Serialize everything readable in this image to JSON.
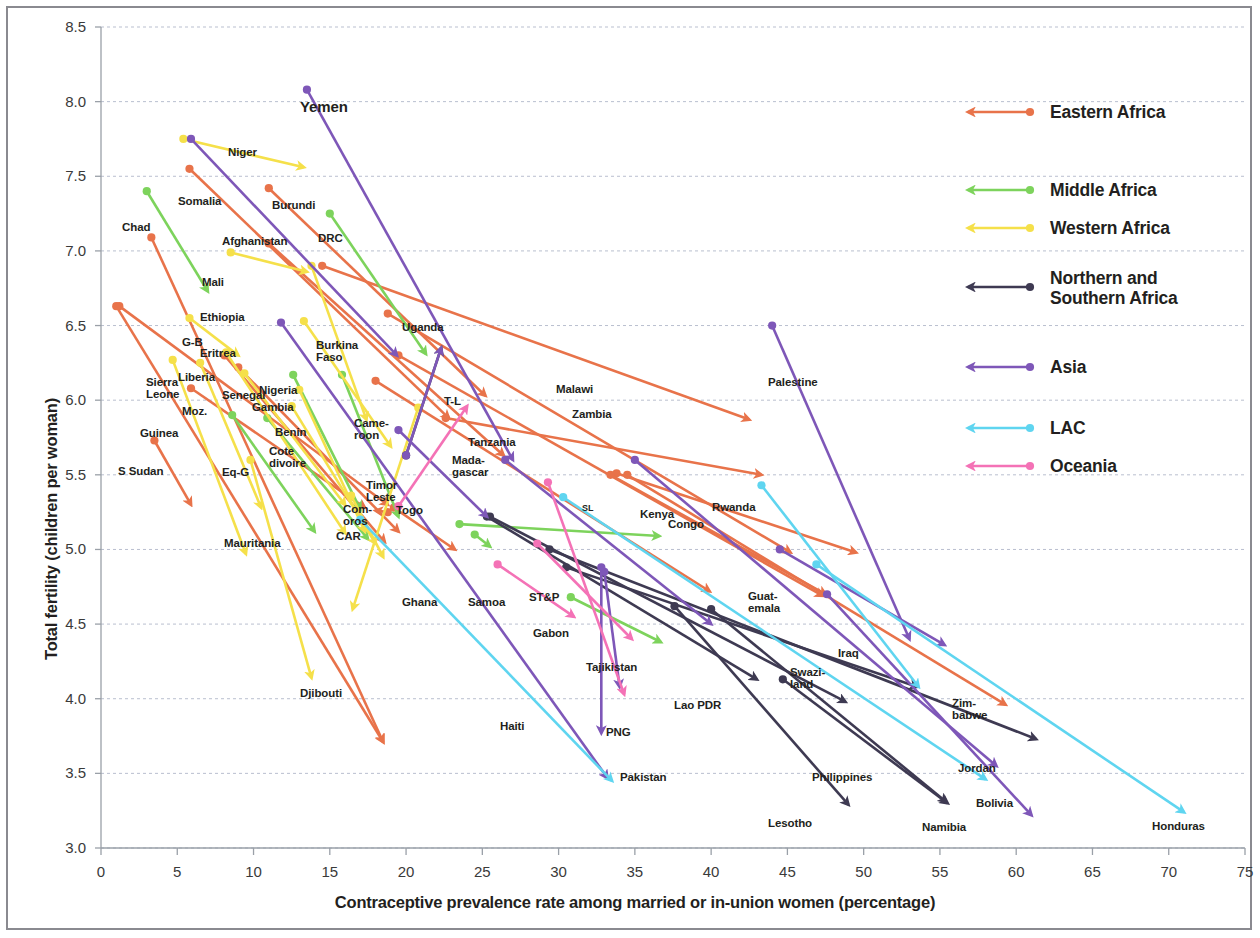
{
  "figure": {
    "xlabel": "Contraceptive prevalence rate among married or in-union women (percentage)",
    "ylabel": "Total fertility (children per woman)"
  },
  "legend": {
    "items": [
      {
        "label": "Eastern Africa",
        "color": "#E8734A",
        "y": 66,
        "lines": 1
      },
      {
        "label": "Middle Africa",
        "color": "#7DD35C",
        "y": 144,
        "lines": 1
      },
      {
        "label": "Western Africa",
        "color": "#F5E04A",
        "y": 182,
        "lines": 1
      },
      {
        "label": "Northern and Southern Africa",
        "color": "#3E3A52",
        "y": 241,
        "lines": 2
      },
      {
        "label": "Asia",
        "color": "#7E57B8",
        "y": 321,
        "lines": 1
      },
      {
        "label": "LAC",
        "color": "#5FD5F0",
        "y": 382,
        "lines": 1
      },
      {
        "label": "Oceania",
        "color": "#F472B6",
        "y": 420,
        "lines": 1
      }
    ]
  },
  "chart_data": {
    "type": "scatter",
    "subtype": "arrow-connected-scatter",
    "title": "",
    "xlabel": "Contraceptive prevalence rate among married or in-union women (percentage)",
    "ylabel": "Total fertility (children per woman)",
    "xlim": [
      0,
      75
    ],
    "ylim": [
      3.0,
      8.5
    ],
    "xticks": [
      0,
      5,
      10,
      15,
      20,
      25,
      30,
      35,
      40,
      45,
      50,
      55,
      60,
      65,
      70,
      75
    ],
    "yticks": [
      3.0,
      3.5,
      4.0,
      4.5,
      5.0,
      5.5,
      6.0,
      6.5,
      7.0,
      7.5,
      8.0,
      8.5
    ],
    "grid": "horizontal-dashed",
    "legend_position": "right",
    "note": "Each segment is an arrow from a start point (dot) to an end point (arrowhead), showing change over time per country.",
    "series": [
      {
        "name": "Eastern Africa",
        "color": "#E8734A",
        "points": [
          {
            "country": "Somalia",
            "x0": 5.8,
            "y0": 7.55,
            "x1": 22.8,
            "y1": 5.88,
            "label": "Somalia",
            "lx": 178,
            "ly": 196
          },
          {
            "country": "Burundi",
            "x0": 11.0,
            "y0": 7.42,
            "x1": 25.2,
            "y1": 6.03,
            "label": "Burundi",
            "lx": 272,
            "ly": 200
          },
          {
            "country": "Chad",
            "x0": 3.3,
            "y0": 7.09,
            "x1": 18.5,
            "y1": 3.71,
            "label": "Chad",
            "lx": 122,
            "ly": 222
          },
          {
            "country": "Afghanistan",
            "x0": 11.0,
            "y0": 7.05,
            "x1": 26.4,
            "y1": 5.63,
            "label": "Afghanistan",
            "lx": 222,
            "ly": 236
          },
          {
            "country": "Ethiopia",
            "x0": 1.2,
            "y0": 6.63,
            "x1": 18.8,
            "y1": 5.3,
            "label": "Ethiopia",
            "lx": 200,
            "ly": 312
          },
          {
            "country": "Uganda",
            "x0": 14.5,
            "y0": 6.9,
            "x1": 42.5,
            "y1": 5.87,
            "label": "Uganda",
            "lx": 402,
            "ly": 322
          },
          {
            "country": "Eritrea",
            "x0": 8.1,
            "y0": 6.3,
            "x1": 18.6,
            "y1": 5.05,
            "label": "Eritrea",
            "lx": 200,
            "ly": 348
          },
          {
            "country": "Malawi",
            "x0": 18.8,
            "y0": 6.58,
            "x1": 45.2,
            "y1": 4.98,
            "label": "Malawi",
            "lx": 556,
            "ly": 384
          },
          {
            "country": "Zambia",
            "x0": 19.5,
            "y0": 6.3,
            "x1": 47.3,
            "y1": 4.69,
            "label": "Zambia",
            "lx": 572,
            "ly": 409
          },
          {
            "country": "Mozambique",
            "x0": 5.9,
            "y0": 6.08,
            "x1": 17.3,
            "y1": 5.28,
            "label": "Moz.",
            "lx": 182,
            "ly": 406
          },
          {
            "country": "Cameroon",
            "x0": 18.0,
            "y0": 6.13,
            "x1": 39.9,
            "y1": 4.72,
            "label": "Came-\nroon",
            "lx": 354,
            "ly": 418
          },
          {
            "country": "Guinea",
            "x0": 3.5,
            "y0": 5.73,
            "x1": 5.9,
            "y1": 5.3,
            "label": "Guinea",
            "lx": 140,
            "ly": 428
          },
          {
            "country": "Tanzania",
            "x0": 22.6,
            "y0": 5.88,
            "x1": 43.3,
            "y1": 5.5,
            "label": "Tanzania",
            "lx": 468,
            "ly": 437
          },
          {
            "country": "S Sudan",
            "x0": 9.0,
            "y0": 6.22,
            "x1": 19.5,
            "y1": 5.12,
            "label": "S Sudan",
            "lx": 118,
            "ly": 466
          },
          {
            "country": "Comoros",
            "x0": 18.8,
            "y0": 5.25,
            "x1": 18.0,
            "y1": 5.26,
            "label": "Com-\noros",
            "lx": 343,
            "ly": 504
          },
          {
            "country": "Togo",
            "x0": 19.2,
            "y0": 5.28,
            "x1": 23.2,
            "y1": 5.0,
            "label": "Togo",
            "lx": 396,
            "ly": 505
          },
          {
            "country": "Rwanda",
            "x0": 33.8,
            "y0": 5.51,
            "x1": 49.5,
            "y1": 4.98,
            "label": "Rwanda",
            "lx": 712,
            "ly": 502
          },
          {
            "country": "Kenya",
            "x0": 33.4,
            "y0": 5.5,
            "x1": 47.5,
            "y1": 4.7,
            "label": "Kenya",
            "lx": 640,
            "ly": 509
          },
          {
            "country": "Zimbabwe",
            "x0": 34.5,
            "y0": 5.5,
            "x1": 59.3,
            "y1": 3.96,
            "label": "Zim-\nbabwe",
            "lx": 952,
            "ly": 698
          },
          {
            "country": "Djibouti",
            "x0": 1.0,
            "y0": 6.63,
            "x1": 18.5,
            "y1": 3.71,
            "label": "Djibouti",
            "lx": 300,
            "ly": 688
          }
        ]
      },
      {
        "name": "Middle Africa",
        "color": "#7DD35C",
        "points": [
          {
            "country": "Chad MA",
            "x0": 3.0,
            "y0": 7.4,
            "x1": 7.0,
            "y1": 6.73,
            "label": "",
            "lx": 0,
            "ly": 0
          },
          {
            "country": "DRC",
            "x0": 15.0,
            "y0": 7.25,
            "x1": 21.3,
            "y1": 6.31,
            "label": "DRC",
            "lx": 318,
            "ly": 233
          },
          {
            "country": "Eq-G",
            "x0": 12.6,
            "y0": 6.17,
            "x1": 17.0,
            "y1": 5.27,
            "label": "Eq-G",
            "lx": 222,
            "ly": 467
          },
          {
            "country": "Gabon",
            "x0": 30.8,
            "y0": 4.68,
            "x1": 36.7,
            "y1": 4.38,
            "label": "Gabon",
            "lx": 533,
            "ly": 628
          },
          {
            "country": "Congo",
            "x0": 23.5,
            "y0": 5.17,
            "x1": 36.6,
            "y1": 5.09,
            "label": "Congo",
            "lx": 668,
            "ly": 519
          },
          {
            "country": "Cameroon MA",
            "x0": 8.6,
            "y0": 5.9,
            "x1": 14.0,
            "y1": 5.12,
            "label": "",
            "lx": 0,
            "ly": 0
          },
          {
            "country": "CAR",
            "x0": 10.9,
            "y0": 5.88,
            "x1": 17.5,
            "y1": 5.07,
            "label": "CAR",
            "lx": 336,
            "ly": 531
          },
          {
            "country": "ST&P",
            "x0": 24.5,
            "y0": 5.1,
            "x1": 25.5,
            "y1": 5.02,
            "label": "ST&P",
            "lx": 529,
            "ly": 592
          },
          {
            "country": "Angola",
            "x0": 15.8,
            "y0": 6.17,
            "x1": 19.5,
            "y1": 5.22,
            "label": "",
            "lx": 0,
            "ly": 0
          }
        ]
      },
      {
        "name": "Western Africa",
        "color": "#F5E04A",
        "points": [
          {
            "country": "Niger",
            "x0": 5.4,
            "y0": 7.75,
            "x1": 13.3,
            "y1": 7.56,
            "label": "Niger",
            "lx": 228,
            "ly": 147
          },
          {
            "country": "Mali",
            "x0": 8.5,
            "y0": 6.99,
            "x1": 13.5,
            "y1": 6.86,
            "label": "Mali",
            "lx": 202,
            "ly": 277
          },
          {
            "country": "Burkina Faso",
            "x0": 13.8,
            "y0": 6.9,
            "x1": 17.4,
            "y1": 5.87,
            "label": "Burkina\nFaso",
            "lx": 316,
            "ly": 340
          },
          {
            "country": "G-B",
            "x0": 5.8,
            "y0": 6.55,
            "x1": 9.0,
            "y1": 6.3,
            "label": "G-B",
            "lx": 182,
            "ly": 337
          },
          {
            "country": "Nigeria",
            "x0": 13.3,
            "y0": 6.53,
            "x1": 19.0,
            "y1": 5.69,
            "label": "Nigeria",
            "lx": 259,
            "ly": 385
          },
          {
            "country": "Senegal",
            "x0": 8.2,
            "y0": 6.32,
            "x1": 16.0,
            "y1": 5.11,
            "label": "Senegal",
            "lx": 222,
            "ly": 390
          },
          {
            "country": "Liberia",
            "x0": 6.5,
            "y0": 6.25,
            "x1": 10.5,
            "y1": 5.28,
            "label": "Liberia",
            "lx": 178,
            "ly": 372
          },
          {
            "country": "Gambia",
            "x0": 9.4,
            "y0": 6.18,
            "x1": 16.0,
            "y1": 5.3,
            "label": "Gambia",
            "lx": 252,
            "ly": 402
          },
          {
            "country": "Sierra Leone",
            "x0": 4.7,
            "y0": 6.27,
            "x1": 9.5,
            "y1": 4.97,
            "label": "Sierra\nLeone",
            "lx": 146,
            "ly": 377
          },
          {
            "country": "Benin",
            "x0": 13.0,
            "y0": 6.07,
            "x1": 17.3,
            "y1": 5.12,
            "label": "Benin",
            "lx": 275,
            "ly": 427
          },
          {
            "country": "Cote divoire",
            "x0": 12.5,
            "y0": 5.96,
            "x1": 18.0,
            "y1": 5.04,
            "label": "Cote\ndivoire",
            "lx": 269,
            "ly": 446
          },
          {
            "country": "Mauritania",
            "x0": 9.8,
            "y0": 5.6,
            "x1": 13.8,
            "y1": 4.14,
            "label": "Mauritania",
            "lx": 224,
            "ly": 538
          },
          {
            "country": "Togo WA",
            "x0": 16.4,
            "y0": 5.36,
            "x1": 18.5,
            "y1": 4.95,
            "label": "",
            "lx": 0,
            "ly": 0
          },
          {
            "country": "Ghana",
            "x0": 20.8,
            "y0": 5.95,
            "x1": 16.5,
            "y1": 4.6,
            "label": "Ghana",
            "lx": 402,
            "ly": 597
          }
        ]
      },
      {
        "name": "Northern and Southern Africa",
        "color": "#3E3A52",
        "points": [
          {
            "country": "Timor Leste",
            "x0": 20.0,
            "y0": 5.63,
            "x1": 22.3,
            "y1": 6.35,
            "label": "Timor\nLeste",
            "lx": 366,
            "ly": 480
          },
          {
            "country": "Madagascar",
            "x0": 25.3,
            "y0": 5.22,
            "x1": 43.0,
            "y1": 4.13,
            "label": "Mada-\ngascar",
            "lx": 452,
            "ly": 455
          },
          {
            "country": "Swaziland",
            "x0": 44.7,
            "y0": 4.13,
            "x1": 55.5,
            "y1": 3.3,
            "label": "Swazi-\nland",
            "lx": 790,
            "ly": 667
          },
          {
            "country": "Lesotho",
            "x0": 37.6,
            "y0": 4.62,
            "x1": 49.0,
            "y1": 3.29,
            "label": "Lesotho",
            "lx": 768,
            "ly": 818
          },
          {
            "country": "Namibia",
            "x0": 40.0,
            "y0": 4.6,
            "x1": 55.4,
            "y1": 3.31,
            "label": "Namibia",
            "lx": 922,
            "ly": 822
          },
          {
            "country": "Lao PDR",
            "x0": 29.4,
            "y0": 5.0,
            "x1": 61.3,
            "y1": 3.73,
            "label": "Lao PDR",
            "lx": 674,
            "ly": 700
          },
          {
            "country": "Jordan NS",
            "x0": 30.5,
            "y0": 4.88,
            "x1": 53.5,
            "y1": 4.08,
            "label": "",
            "lx": 0,
            "ly": 0
          },
          {
            "country": "NS e",
            "x0": 25.5,
            "y0": 5.22,
            "x1": 48.8,
            "y1": 3.98,
            "label": "",
            "lx": 0,
            "ly": 0
          }
        ]
      },
      {
        "name": "Asia",
        "color": "#7E57B8",
        "points": [
          {
            "country": "Yemen",
            "x0": 13.5,
            "y0": 8.08,
            "x1": 27.0,
            "y1": 5.6,
            "label": "Yemen",
            "lx": 300,
            "ly": 99,
            "big": true
          },
          {
            "country": "Niger Asia",
            "x0": 5.9,
            "y0": 7.75,
            "x1": 19.4,
            "y1": 6.3,
            "label": "",
            "lx": 0,
            "ly": 0
          },
          {
            "country": "Palestine",
            "x0": 44.0,
            "y0": 6.5,
            "x1": 53.0,
            "y1": 4.4,
            "label": "Palestine",
            "lx": 768,
            "ly": 377
          },
          {
            "country": "T-L",
            "x0": 20.0,
            "y0": 5.63,
            "x1": 22.3,
            "y1": 6.35,
            "label": "T-L",
            "lx": 444,
            "ly": 396
          },
          {
            "country": "Cameroon A",
            "x0": 19.5,
            "y0": 5.8,
            "x1": 25.3,
            "y1": 5.22,
            "label": "",
            "lx": 0,
            "ly": 0
          },
          {
            "country": "Tajikistan",
            "x0": 33.0,
            "y0": 4.85,
            "x1": 34.0,
            "y1": 4.08,
            "label": "Tajikistan",
            "lx": 586,
            "ly": 662
          },
          {
            "country": "PNG",
            "x0": 32.8,
            "y0": 4.88,
            "x1": 32.8,
            "y1": 3.77,
            "label": "PNG",
            "lx": 606,
            "ly": 727
          },
          {
            "country": "Pakistan",
            "x0": 11.8,
            "y0": 6.52,
            "x1": 33.2,
            "y1": 3.47,
            "label": "Pakistan",
            "lx": 620,
            "ly": 772
          },
          {
            "country": "Iraq",
            "x0": 44.5,
            "y0": 5.0,
            "x1": 55.3,
            "y1": 4.36,
            "label": "Iraq",
            "lx": 838,
            "ly": 648
          },
          {
            "country": "Philippines",
            "x0": 47.6,
            "y0": 4.7,
            "x1": 61.0,
            "y1": 3.22,
            "label": "Philippines",
            "lx": 812,
            "ly": 772
          },
          {
            "country": "Jordan",
            "x0": 35.0,
            "y0": 5.6,
            "x1": 58.7,
            "y1": 3.55,
            "label": "Jordan",
            "lx": 958,
            "ly": 763
          },
          {
            "country": "Samoa A",
            "x0": 26.5,
            "y0": 5.6,
            "x1": 40.0,
            "y1": 4.5,
            "label": "",
            "lx": 0,
            "ly": 0
          }
        ]
      },
      {
        "name": "LAC",
        "color": "#5FD5F0",
        "points": [
          {
            "country": "Guatemala",
            "x0": 43.3,
            "y0": 5.43,
            "x1": 53.6,
            "y1": 4.08,
            "label": "Guat-\nemala",
            "lx": 748,
            "ly": 591
          },
          {
            "country": "Bolivia",
            "x0": 30.3,
            "y0": 5.35,
            "x1": 58.0,
            "y1": 3.46,
            "label": "Bolivia",
            "lx": 976,
            "ly": 798
          },
          {
            "country": "Honduras",
            "x0": 46.9,
            "y0": 4.9,
            "x1": 71.0,
            "y1": 3.24,
            "label": "Honduras",
            "lx": 1152,
            "ly": 821
          },
          {
            "country": "Haiti",
            "x0": 17.0,
            "y0": 5.2,
            "x1": 33.5,
            "y1": 3.45,
            "label": "Haiti",
            "lx": 500,
            "ly": 721
          }
        ]
      },
      {
        "name": "Oceania",
        "color": "#F472B6",
        "points": [
          {
            "country": "Samoa",
            "x0": 19.5,
            "y0": 5.29,
            "x1": 24.0,
            "y1": 5.96,
            "label": "Samoa",
            "lx": 468,
            "ly": 597
          },
          {
            "country": "PNG O",
            "x0": 29.3,
            "y0": 5.45,
            "x1": 34.3,
            "y1": 4.03,
            "label": "",
            "lx": 0,
            "ly": 0
          },
          {
            "country": "Vanuatu",
            "x0": 26.0,
            "y0": 4.9,
            "x1": 31.0,
            "y1": 4.55,
            "label": "",
            "lx": 0,
            "ly": 0
          },
          {
            "country": "Solomon",
            "x0": 28.6,
            "y0": 5.04,
            "x1": 34.8,
            "y1": 4.4,
            "label": "",
            "lx": 0,
            "ly": 0
          }
        ]
      }
    ],
    "extra_labels": [
      {
        "text": "SL",
        "lx": 582,
        "ly": 504,
        "size": "sm"
      }
    ]
  }
}
